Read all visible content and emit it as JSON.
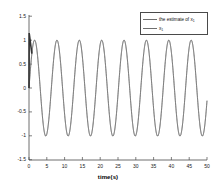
{
  "chart_data": {
    "type": "line",
    "title": "",
    "xlabel": "time(s)",
    "ylabel": "",
    "xlim": [
      0,
      50
    ],
    "ylim": [
      -1.5,
      1.5
    ],
    "xticks": [
      0,
      5,
      10,
      15,
      20,
      25,
      30,
      35,
      40,
      45,
      50
    ],
    "xticklabels": [
      "0",
      "5",
      "10",
      "15",
      "20",
      "25",
      "30",
      "35",
      "40",
      "45",
      "50"
    ],
    "yticks": [
      -1.5,
      -1,
      -0.5,
      0,
      0.5,
      1,
      1.5
    ],
    "yticklabels": [
      "-1.5",
      "-1",
      "-0.5",
      "0",
      "0.5",
      "1",
      "1.5"
    ],
    "grid": false,
    "legend_position": "upper right",
    "series": [
      {
        "name": "the estimate of x",
        "name_subscript": "1",
        "color": "#6e6e6e",
        "description": "sinusoid amplitude 1, angular frequency 1 rad/s, with brief startup transient near t=0"
      },
      {
        "name": "x",
        "name_subscript": "1",
        "color": "#6e6e6e",
        "description": "true state, sinusoid amplitude 1, angular frequency 1 rad/s, overlaps the estimate"
      }
    ],
    "amplitude": 1.0,
    "angular_frequency": 1.0,
    "period": 6.283,
    "peak_times": [
      1.57,
      7.85,
      14.14,
      20.42,
      26.7,
      32.99,
      39.27,
      45.55
    ],
    "trough_times": [
      4.71,
      10.99,
      17.28,
      23.56,
      29.85,
      36.13,
      42.41,
      48.69
    ],
    "peak_value": 1.0,
    "trough_value": -1.0,
    "transient": {
      "t_start": 0.0,
      "t_end": 0.8,
      "y_start": 0.0,
      "y_peak": 1.15,
      "note": "dark vertical overshoot at origin where estimate converges to true state"
    }
  },
  "legend": {
    "entries": [
      {
        "label": "the estimate of x",
        "sub": "1"
      },
      {
        "label": "x",
        "sub": "1"
      }
    ]
  },
  "axis": {
    "xlabel": "time(s)"
  }
}
